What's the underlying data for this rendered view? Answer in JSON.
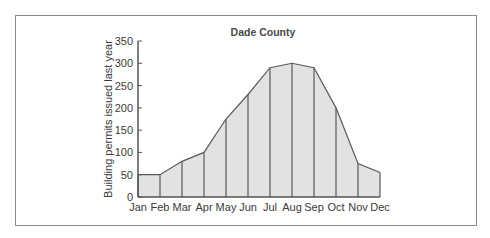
{
  "chart_data": {
    "type": "area",
    "title": "Dade County",
    "xlabel": "",
    "ylabel": "Building permits issued last year",
    "categories": [
      "Jan",
      "Feb",
      "Mar",
      "Apr",
      "May",
      "Jun",
      "Jul",
      "Aug",
      "Sep",
      "Oct",
      "Nov",
      "Dec"
    ],
    "values": [
      50,
      50,
      80,
      100,
      175,
      230,
      290,
      300,
      290,
      200,
      75,
      55
    ],
    "ylim": [
      0,
      350
    ],
    "yticks": [
      0,
      50,
      100,
      150,
      200,
      250,
      300,
      350
    ],
    "grid": false,
    "legend": null,
    "colors": {
      "fill": "#e2e2e2",
      "line": "#5a5a5a",
      "axis": "#555555",
      "frame": "#8a8a8a"
    }
  }
}
